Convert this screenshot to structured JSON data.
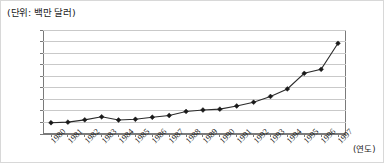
{
  "figure": {
    "unit_label": "(단위: 백만 달러)",
    "xaxis_title": "(연도)"
  },
  "chart_data": {
    "type": "line",
    "title": "",
    "subtitle": "",
    "unit_note": "(단위: 백만 달러)",
    "xlabel": "(연도)",
    "ylabel": "",
    "categories": [
      "1980",
      "1981",
      "1982",
      "1983",
      "1984",
      "1985",
      "1986",
      "1987",
      "1988",
      "1989",
      "1990",
      "1991",
      "1992",
      "1993",
      "1994",
      "1995",
      "1996",
      "1997"
    ],
    "values": [
      1950,
      2050,
      2450,
      2980,
      2420,
      2550,
      2900,
      3200,
      3900,
      4150,
      4300,
      4850,
      5500,
      6500,
      7800,
      10500,
      11200,
      15700
    ],
    "series": [
      {
        "name": "",
        "values": [
          1950,
          2050,
          2450,
          2980,
          2420,
          2550,
          2900,
          3200,
          3900,
          4150,
          4300,
          4850,
          5500,
          6500,
          7800,
          10500,
          11200,
          15700
        ]
      }
    ],
    "ylim": [
      0,
      18000
    ],
    "yticks": [
      0,
      2000,
      4000,
      6000,
      8000,
      10000,
      12000,
      14000,
      16000,
      18000
    ],
    "ytick_labels": [
      "0",
      "2000",
      "4000",
      "6000",
      "8000",
      "10000",
      "12000",
      "14000",
      "16000",
      "18000"
    ],
    "grid": true,
    "grid_axis": "y",
    "legend": false,
    "legend_position": "none",
    "marker": "diamond",
    "line_color": "#2b2b2b",
    "marker_color": "#1a1a1a",
    "grid_color": "#c9c9c9",
    "axis_color": "#7a7a7a",
    "background": "#ffffff"
  }
}
